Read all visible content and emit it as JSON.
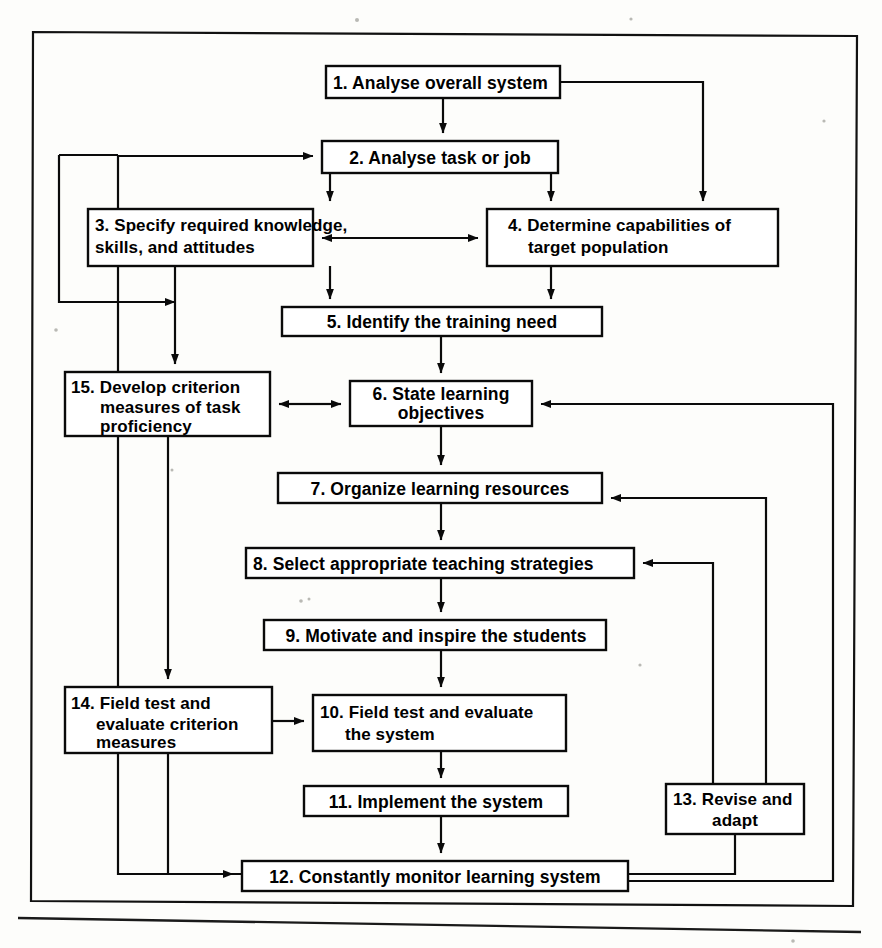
{
  "diagram": {
    "type": "flowchart",
    "background_color": "#fdfdfb",
    "line_color": "#0a0a0a",
    "box_fill": "#ffffff",
    "nodes": [
      {
        "id": "n1",
        "number": "1.",
        "lines": [
          "Analyse overall system"
        ],
        "x": 326,
        "y": 66,
        "w": 234,
        "h": 32,
        "align": "left"
      },
      {
        "id": "n2",
        "number": "2.",
        "lines": [
          "Analyse  task  or  job"
        ],
        "x": 322,
        "y": 141,
        "w": 236,
        "h": 32,
        "align": "center"
      },
      {
        "id": "n3",
        "number": "3.",
        "lines": [
          "Specify required knowledge,",
          "skills, and attitudes"
        ],
        "x": 88,
        "y": 209,
        "w": 225,
        "h": 57,
        "align": "left"
      },
      {
        "id": "n4",
        "number": "4.",
        "lines": [
          "Determine capabilities of",
          "target population"
        ],
        "x": 487,
        "y": 209,
        "w": 291,
        "h": 57,
        "align": "left"
      },
      {
        "id": "n5",
        "number": "5.",
        "lines": [
          "Identify the training need"
        ],
        "x": 282,
        "y": 307,
        "w": 320,
        "h": 29,
        "align": "center"
      },
      {
        "id": "n6",
        "number": "6.",
        "lines": [
          "State learning",
          "objectives"
        ],
        "x": 350,
        "y": 381,
        "w": 182,
        "h": 45,
        "align": "center"
      },
      {
        "id": "n7",
        "number": "7.",
        "lines": [
          "Organize learning resources"
        ],
        "x": 278,
        "y": 473,
        "w": 324,
        "h": 30,
        "align": "center"
      },
      {
        "id": "n8",
        "number": "8.",
        "lines": [
          "Select appropriate teaching strategies"
        ],
        "x": 246,
        "y": 548,
        "w": 388,
        "h": 30,
        "align": "left"
      },
      {
        "id": "n9",
        "number": "9.",
        "lines": [
          "Motivate and inspire the students"
        ],
        "x": 264,
        "y": 620,
        "w": 342,
        "h": 30,
        "align": "center"
      },
      {
        "id": "n10",
        "number": "10.",
        "lines": [
          "Field test and evaluate",
          "the system"
        ],
        "x": 313,
        "y": 695,
        "w": 253,
        "h": 56,
        "align": "left"
      },
      {
        "id": "n11",
        "number": "11.",
        "lines": [
          "Implement the system"
        ],
        "x": 304,
        "y": 786,
        "w": 264,
        "h": 30,
        "align": "center"
      },
      {
        "id": "n12",
        "number": "12.",
        "lines": [
          "Constantly monitor learning system"
        ],
        "x": 242,
        "y": 861,
        "w": 386,
        "h": 30,
        "align": "center"
      },
      {
        "id": "n13",
        "number": "13.",
        "lines": [
          "Revise and",
          "adapt"
        ],
        "x": 666,
        "y": 784,
        "w": 138,
        "h": 50,
        "align": "center"
      },
      {
        "id": "n14",
        "number": "14.",
        "lines": [
          "Field test and",
          "evaluate criterion",
          "measures"
        ],
        "x": 65,
        "y": 687,
        "w": 207,
        "h": 66,
        "align": "left"
      },
      {
        "id": "n15",
        "number": "15.",
        "lines": [
          "Develop criterion",
          "measures of task",
          "proficiency"
        ],
        "x": 65,
        "y": 372,
        "w": 205,
        "h": 64,
        "align": "left"
      }
    ],
    "edges": [
      {
        "from": "n1",
        "to": "n2",
        "label": "analyse overall system to analyse task or job"
      },
      {
        "from": "n1",
        "to": "n4",
        "label": "analyse overall system to determine capabilities"
      },
      {
        "from": "n2",
        "to": "n3",
        "label": "analyse task to specify required knowledge"
      },
      {
        "from": "n2",
        "to": "n4",
        "label": "analyse task to determine capabilities"
      },
      {
        "from": "n3",
        "to": "n4",
        "label": "specify knowledge and determine capabilities",
        "bidirectional": true
      },
      {
        "from": "n3",
        "to": "n5",
        "label": "specify knowledge to identify training need"
      },
      {
        "from": "n4",
        "to": "n5",
        "label": "determine capabilities to identify training need"
      },
      {
        "from": "n5",
        "to": "n6",
        "label": "identify training need to state learning objectives"
      },
      {
        "from": "n6",
        "to": "n15",
        "label": "state objectives and develop criterion measures",
        "bidirectional": true
      },
      {
        "from": "n6",
        "to": "n7",
        "label": "state objectives to organize learning resources"
      },
      {
        "from": "n7",
        "to": "n8",
        "label": "organize resources to select teaching strategies"
      },
      {
        "from": "n8",
        "to": "n9",
        "label": "select strategies to motivate students"
      },
      {
        "from": "n9",
        "to": "n10",
        "label": "motivate students to field test and evaluate system"
      },
      {
        "from": "n10",
        "to": "n11",
        "label": "field test system to implement the system"
      },
      {
        "from": "n11",
        "to": "n12",
        "label": "implement system to constantly monitor"
      },
      {
        "from": "n12",
        "to": "n13",
        "label": "constantly monitor to revise and adapt"
      },
      {
        "from": "n13",
        "to": "n7",
        "label": "revise and adapt back to organize resources"
      },
      {
        "from": "n13",
        "to": "n8",
        "label": "revise and adapt back to select strategies"
      },
      {
        "from": "n12",
        "to": "n6",
        "label": "constantly monitor back to state objectives"
      },
      {
        "from": "n12",
        "to": "n2",
        "label": "constantly monitor back to analyse task or job"
      },
      {
        "from": "n15",
        "to": "n14",
        "label": "develop criterion measures to field test criterion measures"
      },
      {
        "from": "n14",
        "to": "n10",
        "label": "field test criterion measures to field test system"
      },
      {
        "from": "n14",
        "to": "n12",
        "label": "field test criterion measures to constantly monitor"
      },
      {
        "from": "n3",
        "to": "n15",
        "label": "specify knowledge to develop criterion measures"
      }
    ]
  }
}
